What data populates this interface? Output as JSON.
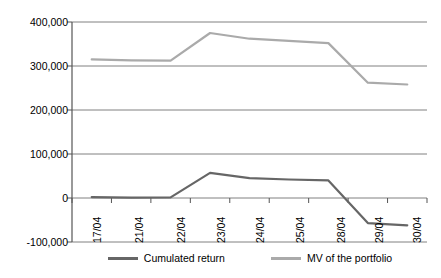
{
  "chart_data": {
    "type": "line",
    "title": "",
    "subtitle": "",
    "xlabel": "",
    "ylabel": "",
    "grid": true,
    "legend_position": "bottom",
    "categories": [
      "17/04",
      "21/04",
      "22/04",
      "23/04",
      "24/04",
      "25/04",
      "28/04",
      "29/04",
      "30/04"
    ],
    "ylim": [
      -100000,
      400000
    ],
    "yticks": [
      -100000,
      0,
      100000,
      200000,
      300000,
      400000
    ],
    "ytick_labels": [
      "-100,000",
      "0",
      "100,000",
      "200,000",
      "300,000",
      "400,000"
    ],
    "series": [
      {
        "name": "Cumulated return",
        "color": "#666666",
        "values": [
          2000,
          1000,
          1500,
          57000,
          45000,
          42000,
          40000,
          -57000,
          -62000
        ]
      },
      {
        "name": "MV of the portfolio",
        "color": "#aaaaaa",
        "values": [
          315000,
          313000,
          312000,
          375000,
          362000,
          357000,
          352000,
          262000,
          258000
        ]
      }
    ]
  },
  "legend": {
    "entries": [
      {
        "label": "Cumulated return",
        "color": "#666666"
      },
      {
        "label": "MV of the portfolio",
        "color": "#aaaaaa"
      }
    ]
  },
  "axis": {
    "y_labels": [
      "400,000",
      "300,000",
      "200,000",
      "100,000",
      "0",
      "-100,000"
    ],
    "x_labels": [
      "17/04",
      "21/04",
      "22/04",
      "23/04",
      "24/04",
      "25/04",
      "28/04",
      "29/04",
      "30/04"
    ]
  }
}
